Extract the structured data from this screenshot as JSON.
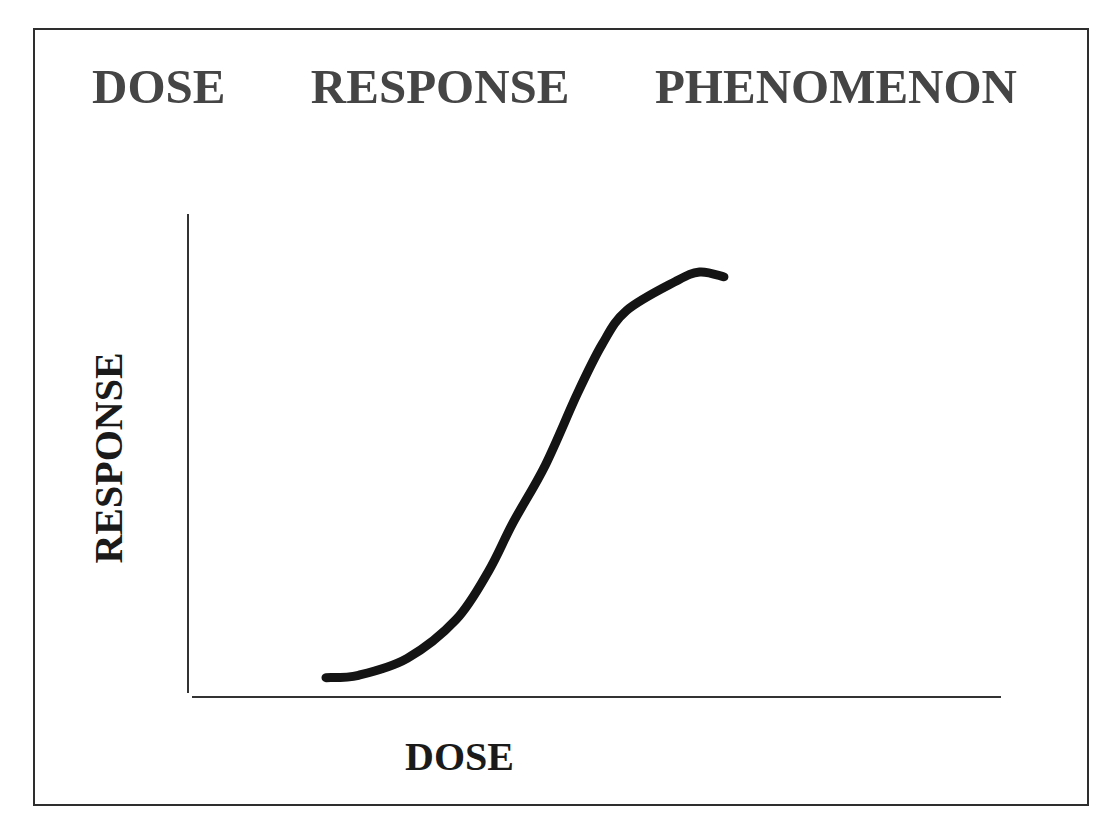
{
  "chart_data": {
    "type": "line",
    "title": "DOSE   RESPONSE   PHENOMENON",
    "title_words": [
      "DOSE",
      "RESPONSE",
      "PHENOMENON"
    ],
    "xlabel": "DOSE",
    "ylabel": "RESPONSE",
    "grid": false,
    "legend": null,
    "x_ticks": [],
    "y_ticks": [],
    "xlim": [
      0,
      100
    ],
    "ylim": [
      0,
      100
    ],
    "series": [
      {
        "name": "dose-response curve",
        "shape": "sigmoidal (S-shaped), slight downturn at top",
        "x": [
          17,
          21,
          27,
          33,
          37,
          40,
          44,
          48,
          51,
          54,
          60,
          63,
          66
        ],
        "y": [
          4,
          4.5,
          8,
          16,
          26,
          36,
          48,
          63,
          73,
          80,
          86,
          88,
          87
        ]
      }
    ],
    "colors": {
      "curve": "#141414",
      "axes": "#333333",
      "title": "#454545",
      "frame": "#2e2e2e"
    }
  }
}
